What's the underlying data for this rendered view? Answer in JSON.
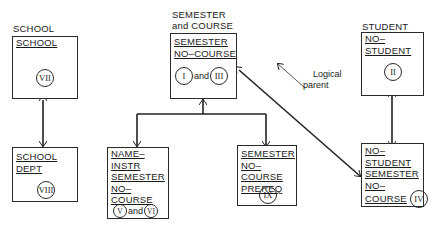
{
  "diagram": {
    "groups": {
      "school": {
        "label": "SCHOOL",
        "parent": {
          "keys": [
            "SCHOOL"
          ],
          "segments": [
            "VII"
          ]
        },
        "child": {
          "keys": [
            "SCHOOL",
            "DEPT"
          ],
          "segments": [
            "VIII"
          ]
        }
      },
      "semester_course": {
        "label_line1": "SEMESTER",
        "label_line2": "and COURSE",
        "root": {
          "keys": [
            "SEMESTER",
            "NO–COURSE"
          ],
          "segments": [
            "I",
            "III"
          ],
          "conjunction": "and"
        },
        "child_left": {
          "keys": [
            "NAME–",
            "INSTR",
            "SEMESTER",
            "NO–",
            "COURSE"
          ],
          "segments": [
            "V",
            "VI"
          ],
          "conjunction": "and"
        },
        "child_right": {
          "keys": [
            "SEMESTER",
            "NO–COURSE",
            "PREREQ"
          ],
          "segments": [
            "IX"
          ]
        }
      },
      "student": {
        "label": "STUDENT",
        "parent": {
          "keys": [
            "NO–",
            "STUDENT"
          ],
          "segments": [
            "II"
          ]
        },
        "child": {
          "keys": [
            "NO–",
            "STUDENT",
            "SEMESTER",
            "NO–",
            "COURSE"
          ],
          "segments": [
            "IV"
          ]
        }
      }
    },
    "annotations": {
      "logical_parent_line1": "Logical",
      "logical_parent_line2": "parent"
    },
    "edges": [
      {
        "from": "SCHOOL (VII)",
        "to": "SCHOOL DEPT (VIII)",
        "type": "parent-child"
      },
      {
        "from": "SEMESTER NO-COURSE (I, III)",
        "to": "NAME-INSTR (V, VI)",
        "type": "parent-child"
      },
      {
        "from": "SEMESTER NO-COURSE (I, III)",
        "to": "PREREQ (IX)",
        "type": "parent-child"
      },
      {
        "from": "NO-STUDENT (II)",
        "to": "NO-STUDENT SEMESTER NO-COURSE (IV)",
        "type": "parent-child"
      },
      {
        "from": "NO-STUDENT SEMESTER NO-COURSE (IV)",
        "to": "SEMESTER NO-COURSE (I, III)",
        "type": "logical-parent"
      }
    ]
  }
}
